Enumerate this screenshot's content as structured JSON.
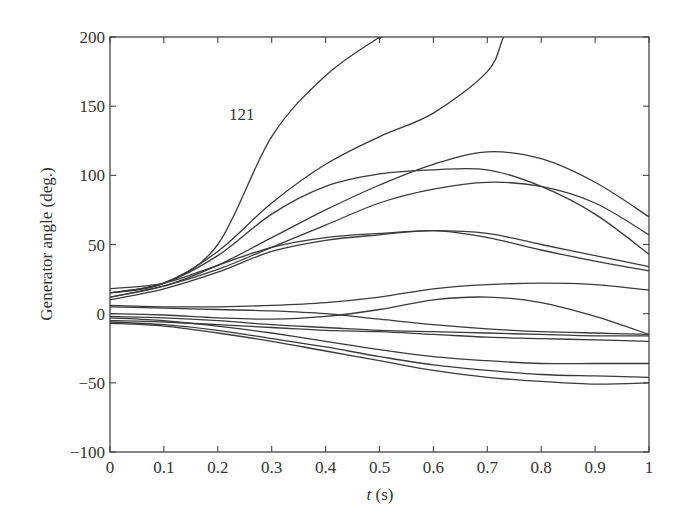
{
  "chart_data": {
    "type": "line",
    "title": "",
    "xlabel": "t (s)",
    "xlabel_italic_part": "t",
    "xlabel_unit": "(s)",
    "ylabel": "Generator angle (deg.)",
    "xlim": [
      0,
      1
    ],
    "ylim": [
      -100,
      200
    ],
    "grid": false,
    "legend": null,
    "x_ticks": [
      0,
      0.1,
      0.2,
      0.3,
      0.4,
      0.5,
      0.6,
      0.7,
      0.8,
      0.9,
      1
    ],
    "x_tick_labels": [
      "0",
      "0.1",
      "0.2",
      "0.3",
      "0.4",
      "0.5",
      "0.6",
      "0.7",
      "0.8",
      "0.9",
      "1"
    ],
    "y_ticks": [
      -100,
      -50,
      0,
      50,
      100,
      150,
      200
    ],
    "y_tick_labels": [
      "−100",
      "−50",
      "0",
      "50",
      "100",
      "150",
      "200"
    ],
    "annotations": [
      {
        "text": "121",
        "x": 0.25,
        "y": 140
      }
    ],
    "x": [
      0,
      0.1,
      0.2,
      0.3,
      0.4,
      0.5,
      0.6,
      0.7,
      0.8,
      0.9,
      1.0
    ],
    "series": [
      {
        "name": "121",
        "values": [
          15,
          22,
          50,
          128,
          172,
          200,
          null,
          null,
          null,
          null,
          null
        ]
      },
      {
        "name": "gen-2",
        "values": [
          15,
          22,
          45,
          80,
          108,
          128,
          145,
          175,
          null,
          null,
          null
        ]
      },
      {
        "name": "gen-3",
        "values": [
          12,
          20,
          35,
          55,
          75,
          93,
          108,
          117,
          112,
          95,
          70
        ]
      },
      {
        "name": "gen-4",
        "values": [
          15,
          22,
          42,
          72,
          92,
          101,
          104,
          104,
          92,
          72,
          43
        ]
      },
      {
        "name": "gen-5",
        "values": [
          12,
          20,
          32,
          48,
          64,
          80,
          90,
          95,
          92,
          80,
          57
        ]
      },
      {
        "name": "gen-6",
        "values": [
          18,
          22,
          35,
          48,
          55,
          58,
          60,
          58,
          50,
          42,
          34
        ]
      },
      {
        "name": "gen-7",
        "values": [
          10,
          18,
          30,
          45,
          53,
          57,
          60,
          55,
          46,
          38,
          31
        ]
      },
      {
        "name": "gen-8",
        "values": [
          6,
          5,
          5,
          6,
          8,
          12,
          18,
          21,
          22,
          21,
          17
        ]
      },
      {
        "name": "gen-9",
        "values": [
          0,
          -1,
          -3,
          -4,
          -2,
          3,
          10,
          12,
          8,
          -2,
          -15
        ]
      },
      {
        "name": "gen-10",
        "values": [
          5,
          4,
          3,
          2,
          0,
          -4,
          -8,
          -11,
          -13,
          -14,
          -15
        ]
      },
      {
        "name": "gen-11",
        "values": [
          -2,
          -3,
          -5,
          -8,
          -10,
          -12,
          -13,
          -14,
          -15,
          -16,
          -16
        ]
      },
      {
        "name": "gen-12",
        "values": [
          -5,
          -6,
          -8,
          -10,
          -12,
          -13,
          -15,
          -17,
          -18,
          -19,
          -20
        ]
      },
      {
        "name": "gen-13",
        "values": [
          -3,
          -5,
          -9,
          -14,
          -20,
          -26,
          -31,
          -34,
          -36,
          -36,
          -36
        ]
      },
      {
        "name": "gen-14",
        "values": [
          -6,
          -8,
          -12,
          -18,
          -24,
          -31,
          -37,
          -41,
          -44,
          -45,
          -46
        ]
      },
      {
        "name": "gen-15",
        "values": [
          -7,
          -9,
          -14,
          -20,
          -27,
          -34,
          -41,
          -46,
          -49,
          -51,
          -50
        ]
      }
    ],
    "exits_top": [
      {
        "name": "121",
        "t_at_200": 0.5
      },
      {
        "name": "gen-2",
        "t_at_200": 0.73
      }
    ]
  },
  "colors": {
    "line": "#3a3a3a",
    "axis": "#444444",
    "text": "#333333",
    "background": "#ffffff"
  }
}
